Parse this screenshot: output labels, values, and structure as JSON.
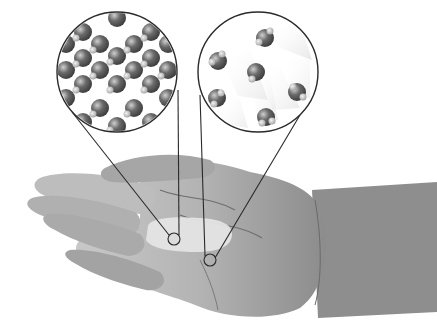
{
  "figure": {
    "insets": [
      {
        "id": "solid",
        "label": "",
        "cx": 117,
        "cy": 72,
        "r": 60,
        "target": {
          "cx": 174,
          "cy": 239,
          "r": 6
        }
      },
      {
        "id": "liquid",
        "label": "",
        "cx": 258,
        "cy": 72,
        "r": 60,
        "target": {
          "cx": 210,
          "cy": 260,
          "r": 6
        }
      }
    ],
    "colors": {
      "background": "#ffffff",
      "outline": "#2a2a2a",
      "molecule_dark": "#555555",
      "molecule_light": "#bdbdbd",
      "skin_light": "#cfcfcf",
      "skin_mid": "#a9a9a9",
      "skin_dark": "#7d7d7d",
      "ice": "#e2e2e2"
    }
  }
}
